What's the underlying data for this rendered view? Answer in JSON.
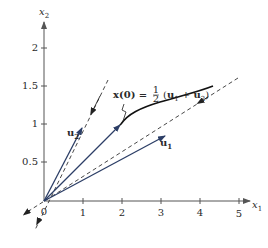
{
  "figure": {
    "type": "vector-phase-diagram",
    "axes": {
      "x_label": "x",
      "x_label_sub": "1",
      "y_label": "x",
      "y_label_sub": "2",
      "x_ticks": [
        "0",
        "1",
        "2",
        "3",
        "4",
        "5"
      ],
      "y_ticks": [
        "0.5",
        "1",
        "1.5",
        "2"
      ],
      "origin_label": "0"
    },
    "vectors": [
      {
        "name": "u2",
        "label": "u",
        "sub": "2",
        "tip": [
          1,
          0.96
        ]
      },
      {
        "name": "x0",
        "label": "",
        "sub": "",
        "tip": [
          2,
          1
        ]
      },
      {
        "name": "u1",
        "label": "u",
        "sub": "1",
        "tip": [
          3.1,
          0.84
        ]
      }
    ],
    "annotation": {
      "lhs": "x(0) = ",
      "frac_num": "1",
      "frac_den": "2",
      "rhs_open": "(",
      "rhs_u1": "u",
      "rhs_u1_sub": "1",
      "plus": " + ",
      "rhs_u2": "u",
      "rhs_u2_sub": "2",
      "rhs_close": ")"
    },
    "colors": {
      "vector": "#2c3e66",
      "axis": "#555555",
      "curve": "#111111",
      "dashed": "#333333",
      "text": "#2a2a2a"
    }
  }
}
